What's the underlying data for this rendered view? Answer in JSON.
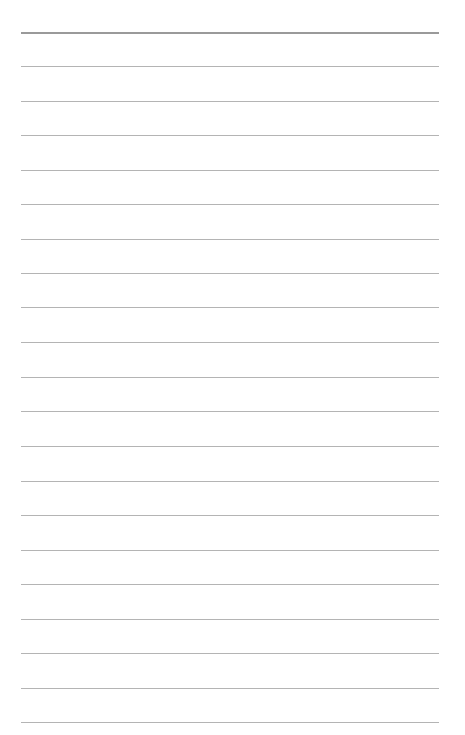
{
  "page": {
    "type": "blank-lined-sheet",
    "background_color": "#ffffff",
    "line_color": "#b4b4b4",
    "top_line_color": "#9a9a9a",
    "line_count": 21,
    "line_positions_y": [
      32,
      66,
      101,
      135,
      170,
      204,
      239,
      273,
      307,
      342,
      377,
      411,
      446,
      481,
      515,
      550,
      584,
      619,
      653,
      688,
      722
    ],
    "line_left_x": 21,
    "line_right_x": 439,
    "text_content": []
  }
}
